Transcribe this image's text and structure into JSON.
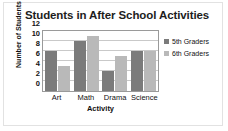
{
  "chart_data": {
    "type": "bar",
    "title": "Students in After School Activities",
    "xlabel": "Activity",
    "ylabel": "Number of Students",
    "categories": [
      "Art",
      "Math",
      "Drama",
      "Science"
    ],
    "series": [
      {
        "name": "5th Graders",
        "color": "#7b7b7b",
        "values": [
          8,
          10,
          4,
          8
        ]
      },
      {
        "name": "6th Graders",
        "color": "#b9b9b9",
        "values": [
          5,
          11,
          7,
          8
        ]
      }
    ],
    "ylim": [
      0,
      12
    ],
    "yticks": [
      0,
      2,
      4,
      6,
      8,
      10,
      12
    ],
    "grid": true,
    "legend_position": "right"
  }
}
